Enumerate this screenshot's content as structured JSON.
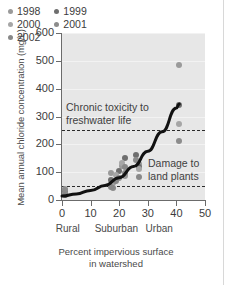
{
  "chart_data": {
    "type": "scatter",
    "title": "",
    "xlabel": "Percent impervious surface in watershed",
    "ylabel": "Mean annual chloride concentration (mg/L)",
    "xlim": [
      0,
      50
    ],
    "ylim": [
      0,
      600
    ],
    "xticks": [
      0,
      10,
      20,
      30,
      40,
      50
    ],
    "yticks": [
      0,
      100,
      200,
      300,
      400,
      500,
      600
    ],
    "grid": true,
    "legend_position": "top-left",
    "category_axis_labels": [
      {
        "label": "Rural",
        "x": 2
      },
      {
        "label": "Suburban",
        "x": 19
      },
      {
        "label": "Urban",
        "x": 34
      }
    ],
    "series": [
      {
        "name": "1998",
        "color": "#9a9a9a",
        "points": [
          [
            1,
            40
          ],
          [
            1,
            25
          ],
          [
            17,
            98
          ],
          [
            18,
            60
          ],
          [
            21,
            122
          ],
          [
            22,
            88
          ],
          [
            27,
            128
          ],
          [
            41,
            485
          ]
        ]
      },
      {
        "name": "1999",
        "color": "#6e6e6e",
        "points": [
          [
            1,
            30
          ],
          [
            17,
            72
          ],
          [
            20,
            105
          ],
          [
            22,
            150
          ],
          [
            26,
            160
          ],
          [
            27,
            120
          ],
          [
            41,
            340
          ]
        ]
      },
      {
        "name": "2000",
        "color": "#a6a6a6",
        "points": [
          [
            1,
            20
          ],
          [
            17,
            55
          ],
          [
            19,
            90
          ],
          [
            21,
            132
          ],
          [
            27,
            112
          ],
          [
            41,
            272
          ]
        ]
      },
      {
        "name": "2001",
        "color": "#8c8c8c",
        "points": [
          [
            1,
            35
          ],
          [
            18,
            42
          ],
          [
            20,
            78
          ],
          [
            22,
            96
          ],
          [
            26,
            145
          ],
          [
            41,
            212
          ]
        ]
      },
      {
        "name": "2002",
        "color": "#888888",
        "points": [
          [
            1,
            18
          ],
          [
            17,
            48
          ],
          [
            19,
            68
          ],
          [
            22,
            118
          ],
          [
            27,
            82
          ]
        ]
      }
    ],
    "trend_curve": {
      "description": "exponential best-fit curve",
      "color": "#111111",
      "points": [
        [
          0,
          14
        ],
        [
          5,
          22
        ],
        [
          10,
          34
        ],
        [
          15,
          52
        ],
        [
          20,
          80
        ],
        [
          25,
          120
        ],
        [
          30,
          175
        ],
        [
          35,
          245
        ],
        [
          40,
          330
        ],
        [
          41,
          345
        ]
      ]
    },
    "threshold_lines": [
      {
        "value": 250,
        "label": "Chronic toxicity to\nfreshwater life",
        "style": "dashed"
      },
      {
        "value": 50,
        "label": "Damage to\nland plants",
        "style": "dashed"
      }
    ],
    "annotations": [
      {
        "id": "chronic",
        "line1": "Chronic toxicity to",
        "line2": "freshwater life"
      },
      {
        "id": "damage",
        "line1": "Damage to",
        "line2": "land plants"
      }
    ]
  },
  "axis": {
    "y_title": "Mean annual chloride concentration (mg/L)",
    "x_title_line1": "Percent impervious surface",
    "x_title_line2": "in watershed"
  }
}
